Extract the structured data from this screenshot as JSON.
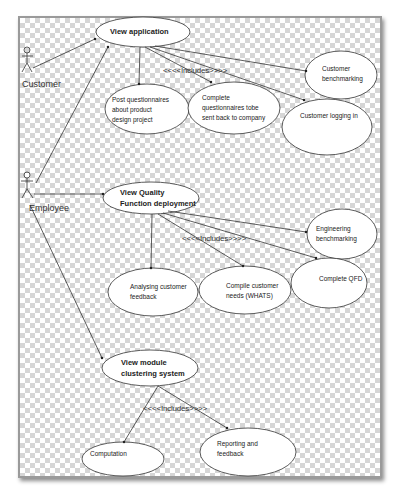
{
  "diagram": {
    "type": "use-case",
    "actors": [
      {
        "id": "customer",
        "label": "Customer"
      },
      {
        "id": "employee",
        "label": "Employee"
      }
    ],
    "use_cases": {
      "view_application": "View application",
      "post_questionnaires": [
        "Post questionnaires",
        "about product",
        "design project"
      ],
      "complete_questionnaires": [
        "Complete",
        "questionnaires tobe",
        "sent back to company"
      ],
      "customer_logging": "Customer logging in",
      "customer_benchmarking": [
        "Customer",
        "benchmarking"
      ],
      "view_qfd": [
        "View Quality",
        "Function deployment"
      ],
      "engineering_benchmarking": [
        "Engineering",
        "benchmarking"
      ],
      "analysing_feedback": [
        "Analysing customer",
        "feedback"
      ],
      "compile_needs": [
        "Compile customer",
        "needs (WHATS)"
      ],
      "complete_qfd": "Complete QFD",
      "view_module": [
        "View module",
        "clustering system"
      ],
      "computation": "Computation",
      "reporting": [
        "Reporting and",
        "feedback"
      ]
    },
    "stereotypes": {
      "includes_1": "<<<<Includes>>>>",
      "includes_2": "<<<<Includes>>>>",
      "includes_3": "<<<<Includes>>>>"
    }
  }
}
